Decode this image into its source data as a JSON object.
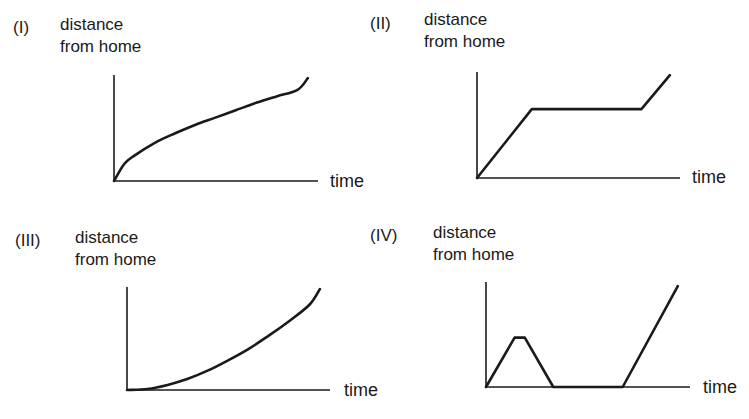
{
  "chart_data": [
    {
      "type": "line",
      "panel": "(I)",
      "ylabel": [
        "distance",
        "from home"
      ],
      "xlabel": "time",
      "shape": "concave increasing (decelerating growth)",
      "x": [
        0,
        0.05,
        0.1,
        0.2,
        0.3,
        0.4,
        0.5,
        0.6,
        0.7,
        0.8,
        0.9,
        0.95
      ],
      "y": [
        0,
        0.16,
        0.24,
        0.36,
        0.45,
        0.53,
        0.6,
        0.67,
        0.74,
        0.8,
        0.86,
        0.97
      ],
      "xlim": [
        0,
        1
      ],
      "ylim": [
        0,
        1
      ]
    },
    {
      "type": "line",
      "panel": "(II)",
      "ylabel": [
        "distance",
        "from home"
      ],
      "xlabel": "time",
      "shape": "rise, flat, rise",
      "x": [
        0,
        0.27,
        0.81,
        0.95
      ],
      "y": [
        0,
        0.65,
        0.65,
        0.97
      ],
      "xlim": [
        0,
        1
      ],
      "ylim": [
        0,
        1
      ]
    },
    {
      "type": "line",
      "panel": "(III)",
      "ylabel": [
        "distance",
        "from home"
      ],
      "xlabel": "time",
      "shape": "convex increasing (accelerating growth)",
      "x": [
        0,
        0.1,
        0.2,
        0.3,
        0.4,
        0.5,
        0.6,
        0.7,
        0.8,
        0.9,
        0.95
      ],
      "y": [
        0,
        0.01,
        0.05,
        0.11,
        0.19,
        0.29,
        0.4,
        0.53,
        0.67,
        0.83,
        0.98
      ],
      "xlim": [
        0,
        1
      ],
      "ylim": [
        0,
        1
      ]
    },
    {
      "type": "line",
      "panel": "(IV)",
      "ylabel": [
        "distance",
        "from home"
      ],
      "xlabel": "time",
      "shape": "rise, short flat, return home, stay home, rise",
      "x": [
        0,
        0.14,
        0.19,
        0.33,
        0.67,
        0.94
      ],
      "y": [
        0,
        0.47,
        0.47,
        0,
        0,
        0.96
      ],
      "xlim": [
        0,
        1
      ],
      "ylim": [
        0,
        1
      ]
    }
  ]
}
